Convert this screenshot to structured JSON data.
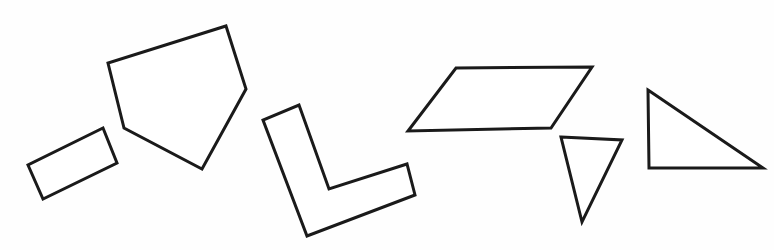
{
  "canvas": {
    "width": 774,
    "height": 250,
    "background_color": "#fefefe",
    "description": "Line drawing of seven simple black-outlined geometric polygons on a plain white background"
  },
  "style": {
    "stroke_color": "#1a1a1a",
    "fill_color": "#ffffff",
    "stroke_width": 3
  },
  "shapes": [
    {
      "id": "rectangle",
      "label": "Tilted rectangle",
      "sides": 4,
      "points": "103,128 117,163 43,199 28,165"
    },
    {
      "id": "pentagon",
      "label": "Irregular pentagon",
      "sides": 5,
      "points": "226,26 246,89 202,169 124,128 108,63"
    },
    {
      "id": "l-shape",
      "label": "L-shaped hexagon",
      "sides": 6,
      "points": "299,105 329,189 407,164 415,195 307,236 263,120"
    },
    {
      "id": "parallelogram",
      "label": "Parallelogram",
      "sides": 4,
      "points": "456,68 592,67 551,128 408,131"
    },
    {
      "id": "small-triangle",
      "label": "Small downward triangle",
      "sides": 3,
      "points": "561,137 622,140 582,222"
    },
    {
      "id": "right-triangle",
      "label": "Right triangle",
      "sides": 3,
      "points": "648,90 763,168 649,168"
    }
  ]
}
